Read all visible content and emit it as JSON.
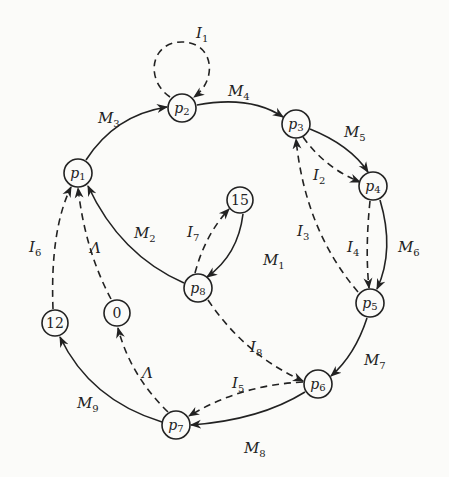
{
  "diagram": {
    "type": "state-transition-graph",
    "nodes": [
      {
        "id": "p1",
        "label": "p",
        "sub": "1"
      },
      {
        "id": "p2",
        "label": "p",
        "sub": "2"
      },
      {
        "id": "p3",
        "label": "p",
        "sub": "3"
      },
      {
        "id": "p4",
        "label": "p",
        "sub": "4"
      },
      {
        "id": "p5",
        "label": "p",
        "sub": "5"
      },
      {
        "id": "p6",
        "label": "p",
        "sub": "6"
      },
      {
        "id": "p7",
        "label": "p",
        "sub": "7"
      },
      {
        "id": "p8",
        "label": "p",
        "sub": "8"
      },
      {
        "id": "n15",
        "label": "15"
      },
      {
        "id": "n12",
        "label": "12"
      },
      {
        "id": "n0",
        "label": "0"
      }
    ],
    "edges": [
      {
        "from": "p1",
        "to": "p2",
        "label": "M",
        "sub": "3",
        "style": "solid"
      },
      {
        "from": "p2",
        "to": "p3",
        "label": "M",
        "sub": "4",
        "style": "solid"
      },
      {
        "from": "p3",
        "to": "p4",
        "label": "M",
        "sub": "5",
        "style": "solid"
      },
      {
        "from": "p4",
        "to": "p5",
        "label": "M",
        "sub": "6",
        "style": "solid"
      },
      {
        "from": "p5",
        "to": "p6",
        "label": "M",
        "sub": "7",
        "style": "solid"
      },
      {
        "from": "p6",
        "to": "p7",
        "label": "M",
        "sub": "8",
        "style": "solid"
      },
      {
        "from": "p7",
        "to": "n12",
        "label": "M",
        "sub": "9",
        "style": "solid"
      },
      {
        "from": "p8",
        "to": "p1",
        "label": "M",
        "sub": "2",
        "style": "solid"
      },
      {
        "from": "n15",
        "to": "p8",
        "label": "M",
        "sub": "1",
        "style": "solid"
      },
      {
        "from": "p2",
        "to": "p2",
        "label": "I",
        "sub": "1",
        "style": "dashed"
      },
      {
        "from": "p3",
        "to": "p4",
        "label": "I",
        "sub": "2",
        "style": "dashed"
      },
      {
        "from": "p5",
        "to": "p3",
        "label": "I",
        "sub": "3",
        "style": "dashed"
      },
      {
        "from": "p4",
        "to": "p5",
        "label": "I",
        "sub": "4",
        "style": "dashed"
      },
      {
        "from": "p6",
        "to": "p7",
        "label": "I",
        "sub": "5",
        "style": "dashed"
      },
      {
        "from": "n12",
        "to": "p1",
        "label": "I",
        "sub": "6",
        "style": "dashed"
      },
      {
        "from": "p8",
        "to": "n15",
        "label": "I",
        "sub": "7",
        "style": "dashed"
      },
      {
        "from": "p8",
        "to": "p6",
        "label": "I",
        "sub": "8",
        "style": "dashed"
      },
      {
        "from": "n0",
        "to": "p1",
        "label": "Λ",
        "style": "dashed"
      },
      {
        "from": "p7",
        "to": "n0",
        "label": "Λ",
        "style": "dashed"
      }
    ]
  },
  "labels": {
    "p1": "p",
    "p1s": "1",
    "p2": "p",
    "p2s": "2",
    "p3": "p",
    "p3s": "3",
    "p4": "p",
    "p4s": "4",
    "p5": "p",
    "p5s": "5",
    "p6": "p",
    "p6s": "6",
    "p7": "p",
    "p7s": "7",
    "p8": "p",
    "p8s": "8",
    "n15": "15",
    "n12": "12",
    "n0": "0",
    "M": "M",
    "I": "I",
    "L": "Λ",
    "s1": "1",
    "s2": "2",
    "s3": "3",
    "s4": "4",
    "s5": "5",
    "s6": "6",
    "s7": "7",
    "s8": "8",
    "s9": "9"
  }
}
